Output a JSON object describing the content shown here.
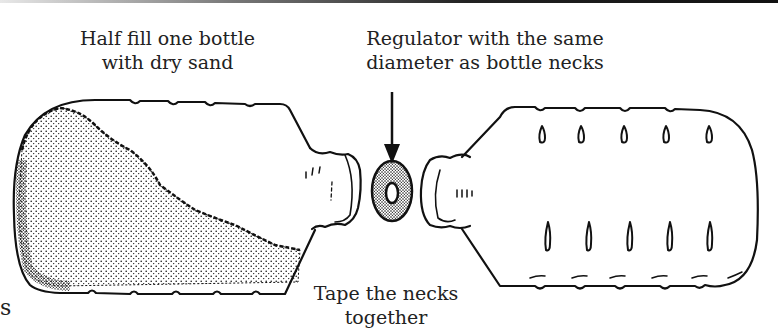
{
  "figure": {
    "labels": {
      "sand_line1": "Half fill one bottle",
      "sand_line2": "with dry sand",
      "regulator_line1": "Regulator with the same",
      "regulator_line2": "diameter as bottle necks",
      "tape_line1": "Tape the necks",
      "tape_line2": "together",
      "edge_fragment": "s"
    },
    "parts": [
      "left-bottle-with-sand",
      "regulator-washer",
      "right-empty-bottle",
      "arrow-to-regulator"
    ],
    "colors": {
      "ink": "#111111",
      "text": "#222222",
      "background": "#ffffff"
    }
  }
}
